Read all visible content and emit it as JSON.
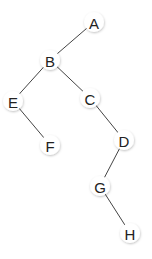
{
  "diagram": {
    "type": "binary-tree",
    "nodes": [
      {
        "id": "A",
        "label": "A",
        "x": 94,
        "y": 22
      },
      {
        "id": "B",
        "label": "B",
        "x": 50,
        "y": 60
      },
      {
        "id": "E",
        "label": "E",
        "x": 13,
        "y": 101
      },
      {
        "id": "C",
        "label": "C",
        "x": 90,
        "y": 98
      },
      {
        "id": "F",
        "label": "F",
        "x": 50,
        "y": 145
      },
      {
        "id": "D",
        "label": "D",
        "x": 124,
        "y": 140
      },
      {
        "id": "G",
        "label": "G",
        "x": 100,
        "y": 186
      },
      {
        "id": "H",
        "label": "H",
        "x": 130,
        "y": 233
      }
    ],
    "edges": [
      {
        "from": "A",
        "to": "B"
      },
      {
        "from": "B",
        "to": "E"
      },
      {
        "from": "B",
        "to": "C"
      },
      {
        "from": "E",
        "to": "F"
      },
      {
        "from": "C",
        "to": "D"
      },
      {
        "from": "D",
        "to": "G"
      },
      {
        "from": "G",
        "to": "H"
      }
    ],
    "colors": {
      "edge": "#444444",
      "node_fill": "#ffffff",
      "label": "#222222"
    }
  }
}
